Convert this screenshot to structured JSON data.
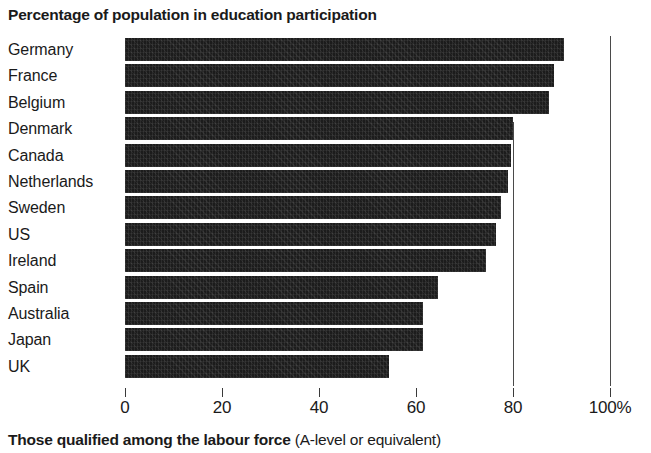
{
  "chart_data": {
    "type": "bar",
    "orientation": "horizontal",
    "title": "Percentage of population in education participation",
    "xlabel": "",
    "ylabel": "",
    "categories": [
      "Germany",
      "France",
      "Belgium",
      "Denmark",
      "Canada",
      "Netherlands",
      "Sweden",
      "US",
      "Ireland",
      "Spain",
      "Australia",
      "Japan",
      "UK"
    ],
    "values": [
      90.5,
      88.5,
      87.5,
      80.0,
      79.5,
      79.0,
      77.5,
      76.5,
      74.5,
      64.5,
      61.5,
      61.5,
      54.5
    ],
    "xlim": [
      0,
      100
    ],
    "xticks": [
      0,
      20,
      40,
      60,
      80,
      100
    ],
    "xtick_labels": [
      "0",
      "20",
      "40",
      "60",
      "80",
      "100%"
    ],
    "grid": false,
    "reference_lines": [
      80,
      100
    ],
    "legend": null,
    "bar_color": "#1c1c1c",
    "axis_color": "#3a3a3a",
    "background": "#ffffff"
  },
  "footer": {
    "caption_bold": "Those qualified among the labour force",
    "caption_regular": "(A-level or equivalent)"
  }
}
